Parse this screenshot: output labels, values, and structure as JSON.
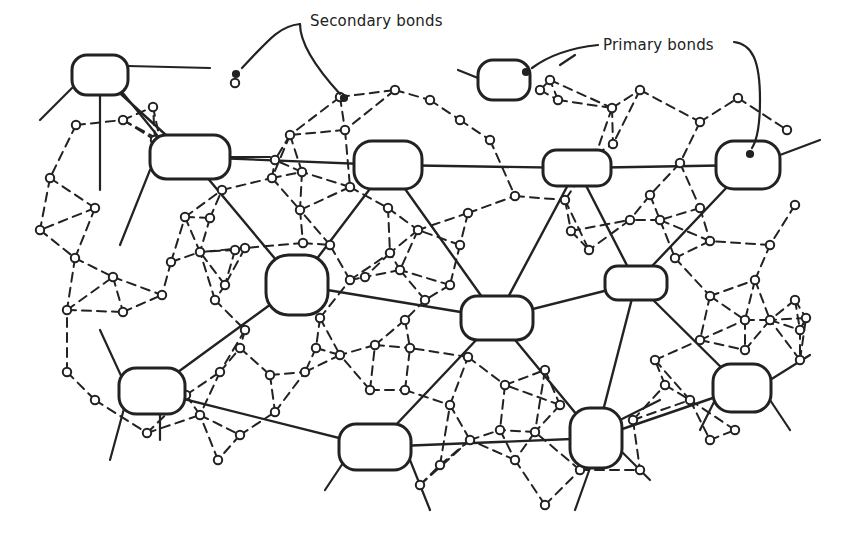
{
  "labels": {
    "secondary": "Secondary bonds",
    "primary": "Primary bonds"
  },
  "colors": {
    "ink": "#222222",
    "background": "#ffffff"
  },
  "primary_nodes": [
    {
      "id": 1,
      "cx": 100,
      "cy": 75,
      "rx": 28,
      "ry": 20
    },
    {
      "id": 2,
      "cx": 190,
      "cy": 157,
      "rx": 40,
      "ry": 22
    },
    {
      "id": 3,
      "cx": 388,
      "cy": 165,
      "rx": 34,
      "ry": 24
    },
    {
      "id": 4,
      "cx": 504,
      "cy": 80,
      "rx": 26,
      "ry": 20
    },
    {
      "id": 5,
      "cx": 577,
      "cy": 168,
      "rx": 34,
      "ry": 18
    },
    {
      "id": 6,
      "cx": 748,
      "cy": 165,
      "rx": 32,
      "ry": 24
    },
    {
      "id": 7,
      "cx": 297,
      "cy": 285,
      "rx": 31,
      "ry": 30
    },
    {
      "id": 8,
      "cx": 497,
      "cy": 318,
      "rx": 36,
      "ry": 22
    },
    {
      "id": 9,
      "cx": 636,
      "cy": 283,
      "rx": 31,
      "ry": 17
    },
    {
      "id": 10,
      "cx": 152,
      "cy": 391,
      "rx": 33,
      "ry": 23
    },
    {
      "id": 11,
      "cx": 742,
      "cy": 388,
      "rx": 29,
      "ry": 24
    },
    {
      "id": 12,
      "cx": 375,
      "cy": 447,
      "rx": 36,
      "ry": 23
    },
    {
      "id": 13,
      "cx": 596,
      "cy": 438,
      "rx": 26,
      "ry": 30
    }
  ],
  "primary_bonds": [
    [
      1,
      2
    ],
    [
      2,
      3
    ],
    [
      3,
      5
    ],
    [
      5,
      6
    ],
    [
      2,
      7
    ],
    [
      3,
      7
    ],
    [
      3,
      8
    ],
    [
      5,
      8
    ],
    [
      5,
      9
    ],
    [
      6,
      9
    ],
    [
      7,
      8
    ],
    [
      8,
      9
    ],
    [
      7,
      10
    ],
    [
      8,
      12
    ],
    [
      8,
      13
    ],
    [
      9,
      13
    ],
    [
      9,
      11
    ],
    [
      10,
      12
    ],
    [
      12,
      13
    ],
    [
      13,
      11
    ]
  ],
  "dangling_primary_bonds": [
    [
      72,
      88,
      40,
      120
    ],
    [
      100,
      95,
      100,
      190
    ],
    [
      128,
      66,
      210,
      68
    ],
    [
      122,
      92,
      157,
      135
    ],
    [
      478,
      78,
      458,
      70
    ],
    [
      560,
      65,
      575,
      55
    ],
    [
      150,
      170,
      120,
      245
    ],
    [
      230,
      157,
      270,
      157
    ],
    [
      780,
      155,
      820,
      140
    ],
    [
      123,
      380,
      100,
      330
    ],
    [
      125,
      405,
      110,
      460
    ],
    [
      160,
      414,
      160,
      440
    ],
    [
      715,
      400,
      700,
      430
    ],
    [
      770,
      380,
      810,
      355
    ],
    [
      770,
      400,
      790,
      430
    ],
    [
      345,
      460,
      325,
      490
    ],
    [
      410,
      460,
      430,
      510
    ],
    [
      590,
      468,
      575,
      510
    ],
    [
      620,
      450,
      650,
      480
    ],
    [
      620,
      420,
      660,
      400
    ]
  ],
  "secondary_molecules": [
    [
      235,
      83
    ],
    [
      290,
      135
    ],
    [
      340,
      97
    ],
    [
      345,
      130
    ],
    [
      395,
      90
    ],
    [
      430,
      100
    ],
    [
      460,
      120
    ],
    [
      490,
      140
    ],
    [
      540,
      90
    ],
    [
      558,
      100
    ],
    [
      612,
      108
    ],
    [
      640,
      90
    ],
    [
      700,
      122
    ],
    [
      738,
      98
    ],
    [
      787,
      130
    ],
    [
      76,
      125
    ],
    [
      123,
      120
    ],
    [
      155,
      140
    ],
    [
      153,
      107
    ],
    [
      50,
      178
    ],
    [
      95,
      208
    ],
    [
      40,
      230
    ],
    [
      75,
      258
    ],
    [
      113,
      277
    ],
    [
      67,
      310
    ],
    [
      123,
      312
    ],
    [
      160,
      140
    ],
    [
      185,
      217
    ],
    [
      210,
      218
    ],
    [
      235,
      250
    ],
    [
      225,
      285
    ],
    [
      245,
      248
    ],
    [
      272,
      178
    ],
    [
      302,
      172
    ],
    [
      350,
      187
    ],
    [
      300,
      210
    ],
    [
      303,
      243
    ],
    [
      275,
      160
    ],
    [
      222,
      190
    ],
    [
      171,
      262
    ],
    [
      200,
      252
    ],
    [
      162,
      295
    ],
    [
      215,
      300
    ],
    [
      245,
      330
    ],
    [
      388,
      208
    ],
    [
      418,
      230
    ],
    [
      468,
      213
    ],
    [
      515,
      196
    ],
    [
      460,
      245
    ],
    [
      400,
      270
    ],
    [
      350,
      280
    ],
    [
      330,
      245
    ],
    [
      390,
      253
    ],
    [
      365,
      277
    ],
    [
      450,
      285
    ],
    [
      425,
      300
    ],
    [
      375,
      345
    ],
    [
      405,
      320
    ],
    [
      320,
      318
    ],
    [
      316,
      348
    ],
    [
      550,
      80
    ],
    [
      596,
      154
    ],
    [
      613,
      144
    ],
    [
      680,
      163
    ],
    [
      650,
      195
    ],
    [
      700,
      208
    ],
    [
      660,
      220
    ],
    [
      565,
      200
    ],
    [
      630,
      220
    ],
    [
      571,
      231
    ],
    [
      589,
      250
    ],
    [
      675,
      258
    ],
    [
      710,
      241
    ],
    [
      795,
      205
    ],
    [
      755,
      280
    ],
    [
      745,
      320
    ],
    [
      795,
      300
    ],
    [
      770,
      245
    ],
    [
      800,
      330
    ],
    [
      710,
      296
    ],
    [
      67,
      372
    ],
    [
      95,
      400
    ],
    [
      147,
      433
    ],
    [
      186,
      395
    ],
    [
      220,
      372
    ],
    [
      240,
      348
    ],
    [
      270,
      375
    ],
    [
      200,
      415
    ],
    [
      240,
      435
    ],
    [
      275,
      412
    ],
    [
      218,
      460
    ],
    [
      305,
      372
    ],
    [
      340,
      355
    ],
    [
      370,
      390
    ],
    [
      405,
      390
    ],
    [
      410,
      348
    ],
    [
      450,
      405
    ],
    [
      468,
      357
    ],
    [
      505,
      385
    ],
    [
      545,
      370
    ],
    [
      560,
      405
    ],
    [
      535,
      432
    ],
    [
      420,
      485
    ],
    [
      440,
      465
    ],
    [
      470,
      440
    ],
    [
      500,
      430
    ],
    [
      515,
      460
    ],
    [
      545,
      505
    ],
    [
      580,
      470
    ],
    [
      633,
      420
    ],
    [
      665,
      385
    ],
    [
      655,
      360
    ],
    [
      690,
      400
    ],
    [
      710,
      440
    ],
    [
      735,
      430
    ],
    [
      640,
      470
    ],
    [
      700,
      340
    ],
    [
      745,
      350
    ],
    [
      770,
      320
    ],
    [
      800,
      360
    ],
    [
      806,
      318
    ]
  ],
  "arrows": {
    "secondary_left": {
      "path": "M300 24 C280 26, 270 38, 242 68",
      "tip": [
        236,
        74
      ]
    },
    "secondary_right": {
      "path": "M300 24 C300 45, 318 70, 340 94",
      "tip": [
        344,
        98
      ]
    },
    "primary_left": {
      "path": "M598 45 C570 48, 548 56, 532 68",
      "tip": [
        526,
        72
      ]
    },
    "primary_right": {
      "path": "M734 42 C752 44, 760 60, 760 100 C760 125, 757 140, 752 148",
      "tip": [
        750,
        154
      ]
    }
  }
}
